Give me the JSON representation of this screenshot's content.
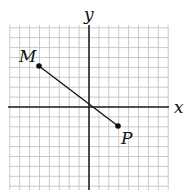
{
  "diagram": {
    "type": "coordinate-plane",
    "grid": {
      "xmin": -8,
      "xmax": 8,
      "ymin": -8,
      "ymax": 8,
      "step": 1
    },
    "axes": {
      "x_label": "x",
      "y_label": "y"
    },
    "points": [
      {
        "name": "M",
        "x": -5,
        "y": 4
      },
      {
        "name": "P",
        "x": 3,
        "y": -2
      }
    ],
    "segment": {
      "from": "M",
      "to": "P"
    },
    "colors": {
      "grid": "#b8b8b8",
      "axis": "#222222",
      "ink": "#111111"
    }
  }
}
